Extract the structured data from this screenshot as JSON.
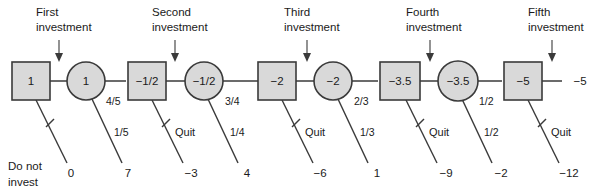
{
  "diagram": {
    "type": "decision-tree",
    "title": "",
    "colors": {
      "node_fill": "#d9d9d9",
      "node_stroke": "#3a3a3a",
      "edge": "#3a3a3a",
      "text": "#1a1a1a",
      "background": "#ffffff"
    },
    "stage_labels": [
      {
        "line1": "First",
        "line2": "investment"
      },
      {
        "line1": "Second",
        "line2": "investment"
      },
      {
        "line1": "Third",
        "line2": "investment"
      },
      {
        "line1": "Fourth",
        "line2": "investment"
      },
      {
        "line1": "Fifth",
        "line2": "investment"
      }
    ],
    "nodes": [
      {
        "kind": "decision",
        "shape": "square",
        "value": "1"
      },
      {
        "kind": "chance",
        "shape": "circle",
        "value": "1"
      },
      {
        "kind": "decision",
        "shape": "square",
        "value": "−1/2"
      },
      {
        "kind": "chance",
        "shape": "circle",
        "value": "−1/2"
      },
      {
        "kind": "decision",
        "shape": "square",
        "value": "−2"
      },
      {
        "kind": "chance",
        "shape": "circle",
        "value": "−2"
      },
      {
        "kind": "decision",
        "shape": "square",
        "value": "−3.5"
      },
      {
        "kind": "chance",
        "shape": "circle",
        "value": "−3.5"
      },
      {
        "kind": "decision",
        "shape": "square",
        "value": "−5"
      }
    ],
    "upper_probabilities": [
      "4/5",
      "3/4",
      "2/3",
      "1/2"
    ],
    "lower_probabilities": [
      "1/5",
      "1/4",
      "1/3",
      "1/2"
    ],
    "quit_labels": [
      "Quit",
      "Quit",
      "Quit",
      "Quit"
    ],
    "do_not_invest": {
      "line1": "Do not",
      "line2": "invest"
    },
    "terminal_payoffs": [
      "0",
      "7",
      "−3",
      "4",
      "−6",
      "1",
      "−9",
      "−2",
      "−12"
    ],
    "final_value": "−5"
  }
}
